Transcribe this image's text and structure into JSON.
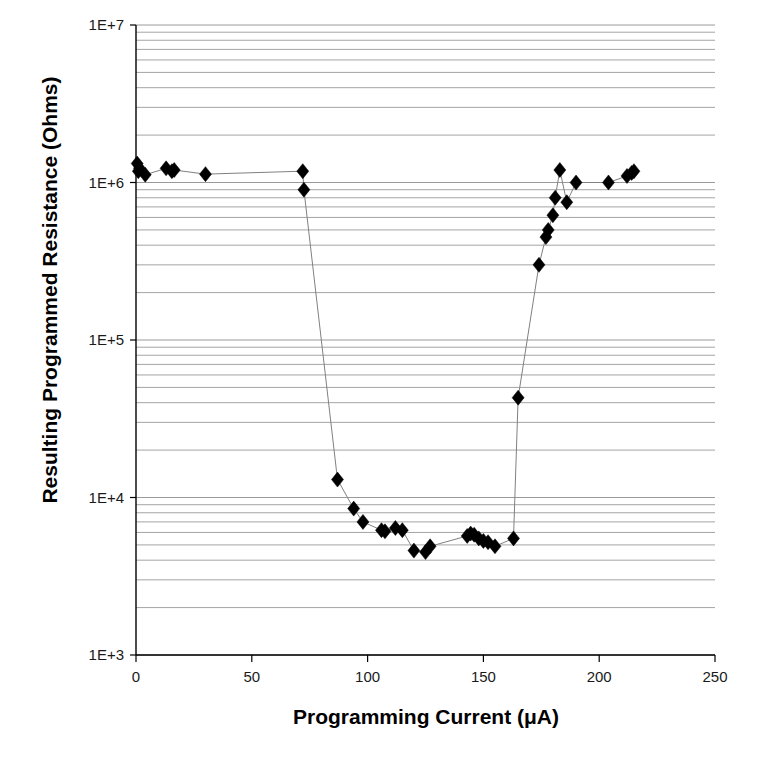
{
  "chart_data": {
    "type": "scatter",
    "title": "",
    "xlabel": "Programming Current (μA)",
    "ylabel": "Resulting Programmed Resistance (Ohms)",
    "xlim": [
      0,
      250
    ],
    "ylim": [
      1000,
      10000000
    ],
    "yscale": "log",
    "xscale": "linear",
    "xticks": [
      0,
      50,
      100,
      150,
      200,
      250
    ],
    "xtick_labels": [
      "0",
      "50",
      "100",
      "150",
      "200",
      "250"
    ],
    "yticks": [
      1000,
      10000,
      100000,
      1000000,
      10000000
    ],
    "ytick_labels": [
      "1E+3",
      "1E+4",
      "1E+5",
      "1E+6",
      "1E+7"
    ],
    "grid": "horizontal-log-minor",
    "legend": "none",
    "marker": "diamond",
    "marker_color": "#000000",
    "line_color": "#808080",
    "series": [
      {
        "name": "Programmed Resistance",
        "x": [
          0.5,
          1.0,
          1.5,
          4.0,
          13.0,
          15.5,
          16.5,
          30.0,
          72.0,
          72.5,
          87.0,
          94.0,
          98.0,
          106.0,
          107.5,
          112.0,
          115.0,
          120.0,
          125.0,
          127.0,
          143.0,
          144.5,
          146.0,
          148.0,
          150.0,
          152.0,
          155.0,
          163.0,
          165.0,
          174.0,
          177.0,
          178.0,
          180.0,
          181.0,
          183.0,
          186.0,
          190.0,
          204.0,
          212.0,
          214.0,
          215.0
        ],
        "y": [
          1320000.0,
          1180000.0,
          1230000.0,
          1120000.0,
          1230000.0,
          1180000.0,
          1200000.0,
          1130000.0,
          1180000.0,
          900000.0,
          13000.0,
          8500.0,
          7000.0,
          6200.0,
          6100.0,
          6400.0,
          6200.0,
          4600.0,
          4500.0,
          4900.0,
          5700.0,
          5900.0,
          5800.0,
          5500.0,
          5300.0,
          5200.0,
          4900.0,
          5500.0,
          43000.0,
          300000.0,
          450000.0,
          500000.0,
          620000.0,
          800000.0,
          1200000.0,
          750000.0,
          1000000.0,
          1000000.0,
          1100000.0,
          1150000.0,
          1180000.0
        ]
      }
    ]
  },
  "axes": {
    "y_title": "Resulting Programmed Resistance (Ohms)",
    "x_title": "Programming Current (μA)"
  },
  "style": {
    "axis_color": "#000000",
    "grid_color": "#9a9a9a",
    "background": "#ffffff"
  }
}
